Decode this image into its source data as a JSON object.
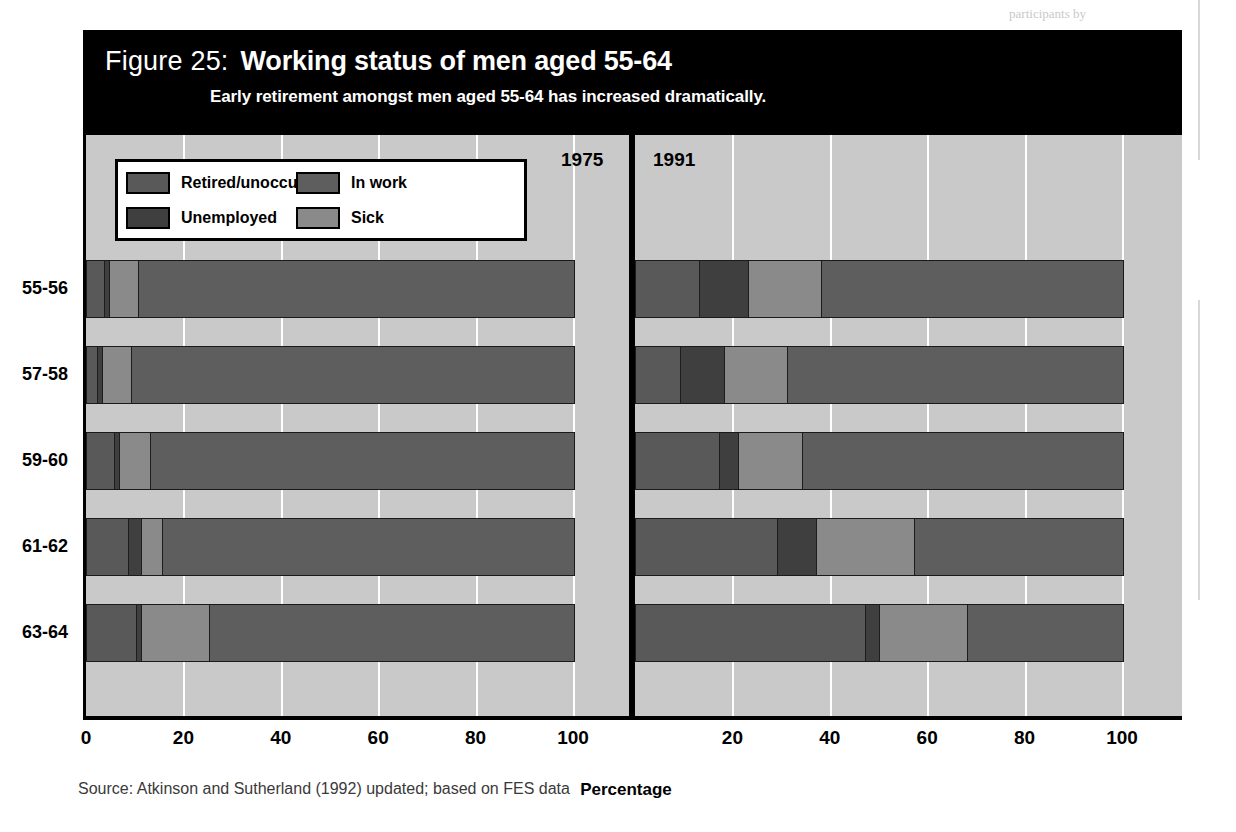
{
  "page": {
    "top_note_left": "participants to…",
    "top_note_right": "participants by"
  },
  "figure": {
    "label": "Figure 25:",
    "title": "Working status of men aged 55-64",
    "subtitle": "Early retirement amongst men aged 55-64 has increased dramatically.",
    "source": "Source: Atkinson and Sutherland (1992) updated; based on FES data"
  },
  "legend": [
    {
      "label": "Retired/unoccupied",
      "color": "#595959"
    },
    {
      "label": "In work",
      "color": "#5e5e5e"
    },
    {
      "label": "Unemployed",
      "color": "#3f3f3f"
    },
    {
      "label": "Sick",
      "color": "#8a8a8a"
    }
  ],
  "panels": [
    {
      "year": "1975"
    },
    {
      "year": "1991"
    }
  ],
  "chart_data": {
    "type": "bar",
    "title": "Working status of men aged 55-64",
    "subtitle": "Early retirement amongst men aged 55-64 has increased dramatically.",
    "xlabel": "Percentage",
    "ylabel": "",
    "xlim": [
      0,
      100
    ],
    "ticks": [
      0,
      20,
      40,
      60,
      80,
      100
    ],
    "tick_labels": [
      "0",
      "20",
      "40",
      "60",
      "80",
      "100"
    ],
    "grid": true,
    "orientation": "horizontal",
    "stacked": true,
    "legend_position": "top-left",
    "categories": [
      "55-56",
      "57-58",
      "59-60",
      "61-62",
      "63-64"
    ],
    "series_names": [
      "Retired/unoccupied",
      "Unemployed",
      "Sick",
      "In work"
    ],
    "series_colors": [
      "#595959",
      "#3f3f3f",
      "#8a8a8a",
      "#5e5e5e"
    ],
    "panels": [
      {
        "name": "1975",
        "series": [
          {
            "name": "Retired/unoccupied",
            "values": [
              3.5,
              2.0,
              5.5,
              8.5,
              10.0
            ]
          },
          {
            "name": "Unemployed",
            "values": [
              1.0,
              1.0,
              1.0,
              2.5,
              1.0
            ]
          },
          {
            "name": "Sick",
            "values": [
              6.0,
              6.0,
              6.5,
              4.5,
              14.0
            ]
          },
          {
            "name": "In work",
            "values": [
              89.5,
              91.0,
              87.0,
              84.5,
              75.0
            ]
          }
        ]
      },
      {
        "name": "1991",
        "series": [
          {
            "name": "Retired/unoccupied",
            "values": [
              13.0,
              9.0,
              17.0,
              29.0,
              47.0
            ]
          },
          {
            "name": "Unemployed",
            "values": [
              10.0,
              9.0,
              4.0,
              8.0,
              3.0
            ]
          },
          {
            "name": "Sick",
            "values": [
              15.0,
              13.0,
              13.0,
              20.0,
              18.0
            ]
          },
          {
            "name": "In work",
            "values": [
              62.0,
              69.0,
              66.0,
              43.0,
              32.0
            ]
          }
        ]
      }
    ]
  }
}
